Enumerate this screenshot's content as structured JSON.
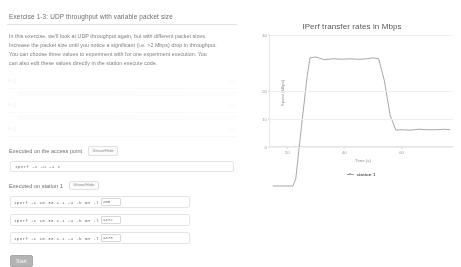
{
  "exercise": {
    "title": "Exercise 1-3: UDP throughput with variable packet size",
    "intro_lines": [
      "In this exercise, we'll look at UDP throughput again, but with different packet sizes.",
      "Increase the packet size until you notice a significant (i.e. >2 Mbps) drop in throughput.",
      "You can choose three values to experiment with for one experiment execution. You",
      "can also edit these values directly in the station execute code."
    ]
  },
  "faded_code": {
    "rows": [
      {
        "line_no": "In [ ]:",
        "right_no": "[ ]:",
        "code": "from experiment import Experiment, Node, Link, Station"
      },
      {
        "line_no": "In [ ]:",
        "right_no": "[ ]:",
        "code": "exp = Experiment( name = 'udp-variable-packet-size' )"
      },
      {
        "line_no": "In [ ]:",
        "right_no": "[ ]:",
        "code": "exp.add_station( 'station 1', iperf_args )"
      }
    ]
  },
  "access_point": {
    "label": "Executed on the access point",
    "showhide_label": "Show/Hide",
    "command": "iperf -s -u -i 1"
  },
  "station": {
    "label": "Executed on station 1",
    "showhide_label": "Show/Hide",
    "commands": [
      {
        "prefix": "iperf -c 10.33.1.1 -u -b 5M -l",
        "length": "200"
      },
      {
        "prefix": "iperf -c 10.33.1.1 -u -b 5M -l",
        "length": "1472"
      },
      {
        "prefix": "iperf -c 10.33.1.1 -u -b 5M -l",
        "length": "1473"
      }
    ]
  },
  "actions": {
    "start_label": "Start"
  },
  "chart_data": {
    "type": "line",
    "title": "IPerf transfer rates in Mbps",
    "xlabel": "Time (s)",
    "ylabel": "Speed (Mbps)",
    "xlim": [
      14,
      78
    ],
    "ylim": [
      0,
      40
    ],
    "xticks": [
      20,
      40,
      60
    ],
    "yticks": [
      0,
      10,
      20,
      40
    ],
    "grid": true,
    "legend_position": "bottom",
    "series": [
      {
        "name": "station 1",
        "color": "#9d9d9d",
        "x": [
          15,
          18,
          20,
          22,
          23,
          25,
          27,
          28,
          30,
          33,
          36,
          39,
          42,
          45,
          48,
          50,
          52,
          54,
          56,
          58,
          60,
          63,
          66,
          69,
          72,
          75,
          77
        ],
        "y": [
          7.0,
          7.0,
          7.0,
          7.0,
          8.5,
          20.0,
          31.0,
          35.0,
          35.2,
          34.6,
          34.8,
          34.7,
          34.8,
          34.7,
          34.8,
          35.0,
          34.8,
          30.0,
          22.5,
          19.2,
          19.3,
          19.2,
          19.4,
          19.3,
          19.3,
          19.4,
          19.3
        ]
      }
    ]
  }
}
